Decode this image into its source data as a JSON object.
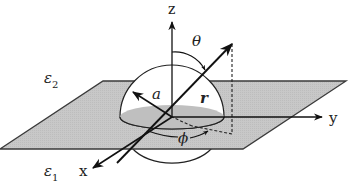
{
  "diagram": {
    "type": "spherical coordinates over dielectric interface",
    "labels": {
      "z_axis": "z",
      "y_axis": "y",
      "x_axis": "x",
      "polar_angle": "θ",
      "azimuth_angle": "ϕ",
      "radius_hemisphere": "a",
      "position_vector": "r",
      "upper_medium": "ε",
      "upper_medium_sub": "2",
      "lower_medium": "ε",
      "lower_medium_sub": "1"
    },
    "colors": {
      "plane_fill": "#c8c8c8",
      "plane_edge": "#3a3a3a",
      "hemisphere_fill": "#ffffff",
      "hemisphere_base_shadow": "#b4b4b4",
      "lines": "#111111",
      "background": "#ffffff"
    }
  }
}
